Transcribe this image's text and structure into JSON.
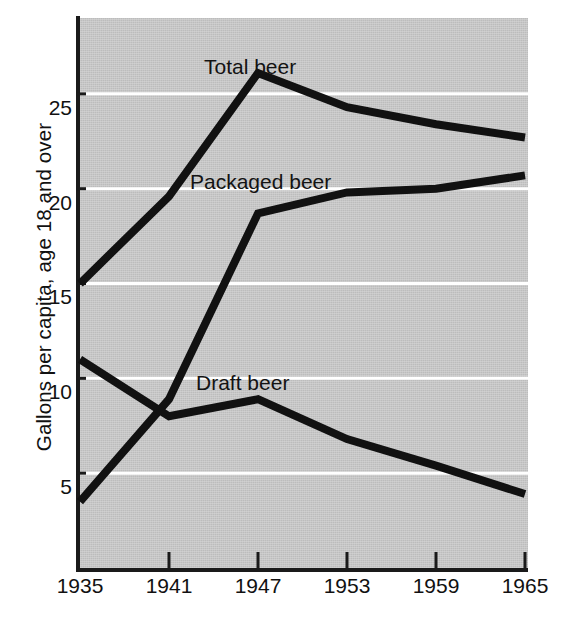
{
  "chart_data": {
    "type": "line",
    "title": "",
    "xlabel": "",
    "ylabel": "Gallons per capita, age 18 and over",
    "x": [
      1935,
      1941,
      1947,
      1953,
      1959,
      1965
    ],
    "xtick_labels": [
      "1935",
      "1941",
      "1947",
      "1953",
      "1959",
      "1965"
    ],
    "ytick_labels": [
      "5",
      "10",
      "15",
      "20",
      "25"
    ],
    "yticks": [
      5,
      10,
      15,
      20,
      25
    ],
    "xlim": [
      1935,
      1965
    ],
    "ylim": [
      0,
      29
    ],
    "grid": "horizontal-white-gridlines",
    "legend": "inline-annotations",
    "plot_background": "#c3c3c3",
    "line_color": "#111111",
    "gridline_color": "#ffffff",
    "series": [
      {
        "name": "Total beer",
        "label": "Total beer",
        "values": [
          15.0,
          19.6,
          26.1,
          24.3,
          23.4,
          22.7
        ]
      },
      {
        "name": "Packaged beer",
        "label": "Packaged beer",
        "values": [
          3.5,
          8.9,
          18.7,
          19.8,
          20.0,
          20.7
        ]
      },
      {
        "name": "Draft beer",
        "label": "Draft beer",
        "values": [
          11.0,
          8.0,
          8.9,
          6.8,
          5.4,
          3.9
        ]
      }
    ],
    "annotations": [
      {
        "text": "Total beer",
        "x_px": 204,
        "y_px": 56
      },
      {
        "text": "Packaged beer",
        "x_px": 190,
        "y_px": 171
      },
      {
        "text": "Draft beer",
        "x_px": 196,
        "y_px": 372
      }
    ]
  }
}
